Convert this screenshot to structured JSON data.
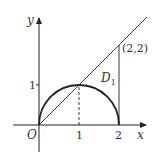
{
  "diagram": {
    "axes": {
      "x_label": "x",
      "y_label": "y",
      "origin_label": "O"
    },
    "ticks": {
      "x": [
        "1",
        "2"
      ],
      "y": [
        "1"
      ]
    },
    "region_label": "D",
    "region_subscript": "1",
    "point_label": "(2,2)",
    "curves": [
      {
        "name": "semicircle",
        "description": "upper half of circle centered (1,0) radius 1"
      },
      {
        "name": "line",
        "description": "y = x"
      },
      {
        "name": "vertical-line",
        "description": "x = 2 from (2,0) to (2,2)"
      },
      {
        "name": "dashed-guide",
        "description": "x = 1 from (1,0) to (1,1)"
      }
    ],
    "colors": {
      "stroke": "#222222",
      "background": "#ffffff"
    }
  }
}
